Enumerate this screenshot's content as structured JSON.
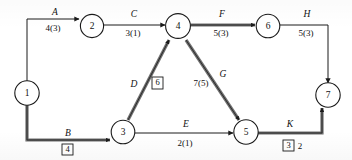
{
  "diagram": {
    "type": "activity-on-arrow network diagram",
    "nodes": [
      {
        "id": "n1",
        "label": "1",
        "x": 27,
        "y": 93
      },
      {
        "id": "n2",
        "label": "2",
        "x": 92,
        "y": 27
      },
      {
        "id": "n3",
        "label": "3",
        "x": 123,
        "y": 131
      },
      {
        "id": "n4",
        "label": "4",
        "x": 178,
        "y": 28
      },
      {
        "id": "n5",
        "label": "5",
        "x": 246,
        "y": 131
      },
      {
        "id": "n6",
        "label": "6",
        "x": 268,
        "y": 27
      },
      {
        "id": "n7",
        "label": "7",
        "x": 328,
        "y": 95
      }
    ],
    "edges": [
      {
        "id": "edge-a",
        "name": "A",
        "from": "1",
        "to": "2",
        "duration": "4(3)",
        "boxed": null,
        "extra": null,
        "critical": false
      },
      {
        "id": "edge-b",
        "name": "B",
        "from": "1",
        "to": "3",
        "duration": null,
        "boxed": "4",
        "extra": null,
        "critical": true
      },
      {
        "id": "edge-c",
        "name": "C",
        "from": "2",
        "to": "4",
        "duration": "3(1)",
        "boxed": null,
        "extra": null,
        "critical": false
      },
      {
        "id": "edge-d",
        "name": "D",
        "from": "3",
        "to": "4",
        "duration": null,
        "boxed": "6",
        "extra": null,
        "critical": true
      },
      {
        "id": "edge-e",
        "name": "E",
        "from": "3",
        "to": "5",
        "duration": "2(1)",
        "boxed": null,
        "extra": null,
        "critical": false
      },
      {
        "id": "edge-f",
        "name": "F",
        "from": "4",
        "to": "6",
        "duration": "5(3)",
        "boxed": null,
        "extra": null,
        "critical": true
      },
      {
        "id": "edge-g",
        "name": "G",
        "from": "4",
        "to": "5",
        "duration": "7(5)",
        "boxed": null,
        "extra": null,
        "critical": true
      },
      {
        "id": "edge-h",
        "name": "H",
        "from": "6",
        "to": "7",
        "duration": "5(3)",
        "boxed": null,
        "extra": null,
        "critical": false
      },
      {
        "id": "edge-k",
        "name": "K",
        "from": "5",
        "to": "7",
        "duration": null,
        "boxed": "3",
        "extra": "2",
        "critical": true
      }
    ],
    "colors": {
      "ink": "#1a1a1a",
      "paper": "#ffffff",
      "critical": "#6f6f6f"
    }
  }
}
